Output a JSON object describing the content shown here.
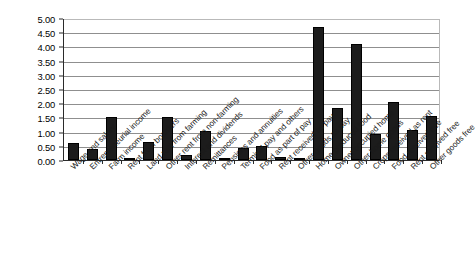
{
  "chart_data": {
    "type": "bar",
    "title": "",
    "subtitle": "",
    "xlabel": "",
    "ylabel": "",
    "ylim": [
      0,
      5
    ],
    "ytick_step": 0.5,
    "grid": true,
    "legend": "none",
    "bar_color": "#1c1c1c",
    "ytick_labels": [
      "5.00",
      "4.50",
      "4.00",
      "3.50",
      "3.00",
      "2.50",
      "2.00",
      "1.50",
      "1.00",
      "0.50",
      "0.00"
    ],
    "ytick_values": [
      5.0,
      4.5,
      4.0,
      3.5,
      3.0,
      2.5,
      2.0,
      1.5,
      1.0,
      0.5,
      0.0
    ],
    "categories": [
      "Wage and salary",
      "Entrepreneurial income",
      "Farm income",
      "Rent from boarders",
      "Land rent from farming",
      "Other rent from non-farming",
      "Interest and dividends",
      "Remittances",
      "Pensions and annuities",
      "Terminal pay and others",
      "Food as part of pay",
      "Rent received as pay",
      "Other goods as pay",
      "Home produced food",
      "Owner occupied home",
      "Other home goods",
      "Crops received as rent",
      "Food received free",
      "Rent received free",
      "Other goods free"
    ],
    "values": [
      0.6,
      0.39,
      1.53,
      0.06,
      0.62,
      1.52,
      0.16,
      1.02,
      0.03,
      0.43,
      0.5,
      0.12,
      0.08,
      4.68,
      1.82,
      4.08,
      0.93,
      2.05,
      1.05,
      1.55
    ]
  }
}
